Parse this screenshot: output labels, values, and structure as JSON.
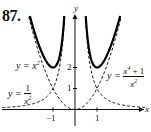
{
  "problem_number": "87.",
  "chart_data": {
    "type": "line",
    "title": "",
    "xlabel": "x",
    "ylabel": "y",
    "x_ticks": [
      "-1",
      "1"
    ],
    "y_ticks": [
      "1",
      "2"
    ],
    "xlim": [
      -3.3,
      3.2
    ],
    "ylim": [
      -0.8,
      4.5
    ],
    "grid": false,
    "series": [
      {
        "name": "y = x^2",
        "style": "dashed",
        "label_text": "y = x²",
        "x": [
          -2.1,
          -1.5,
          -1,
          -0.5,
          0,
          0.5,
          1,
          1.5,
          2.1
        ],
        "y": [
          4.41,
          2.25,
          1,
          0.25,
          0,
          0.25,
          1,
          2.25,
          4.41
        ]
      },
      {
        "name": "y = 1/x^2",
        "style": "dashed",
        "label_text": "y = 1/x²",
        "x": [
          -3.2,
          -2,
          -1.5,
          -1,
          -0.7,
          -0.48,
          0.48,
          0.7,
          1,
          1.5,
          2,
          3.2
        ],
        "y": [
          0.1,
          0.25,
          0.44,
          1,
          2.04,
          4.34,
          4.34,
          2.04,
          1,
          0.44,
          0.25,
          0.1
        ]
      },
      {
        "name": "y = (x^4 + 1)/x^2",
        "style": "solid-bold",
        "label_text": "y = (x⁴ + 1)/x²",
        "x": [
          -2.05,
          -1.5,
          -1,
          -0.7,
          -0.5,
          0.5,
          0.7,
          1,
          1.5,
          2.05
        ],
        "y": [
          4.44,
          2.69,
          2,
          2.53,
          4.25,
          4.25,
          2.53,
          2,
          2.69,
          4.44
        ]
      }
    ],
    "annotations": [
      "y = x²",
      "y = 1/x²",
      "y = (x⁴ + 1)/x²"
    ]
  },
  "labels": {
    "x_axis": "x",
    "y_axis": "y",
    "tick_neg1": "−1",
    "tick_1": "1",
    "tick_y1": "1",
    "tick_y2": "2",
    "eq_x2_left": "y = x",
    "eq_x2_exp": "2",
    "eq_inv_prefix": "y =",
    "eq_inv_num": "1",
    "eq_inv_den": "x",
    "eq_inv_exp": "2",
    "eq_sum_prefix": "y =",
    "eq_sum_num": "x",
    "eq_sum_num_exp": "4",
    "eq_sum_num_tail": " + 1",
    "eq_sum_den": "x",
    "eq_sum_den_exp": "2"
  }
}
